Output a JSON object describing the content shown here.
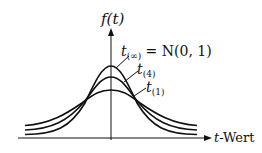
{
  "diagram": {
    "y_axis_label": "f(t)",
    "x_axis_label": "t-Wert",
    "x_axis_label_var": "t",
    "x_axis_label_rest": "-Wert",
    "curves": [
      {
        "name": "t(∞)",
        "sub": "(∞)",
        "eq": " = N(0, 1)",
        "peak_y": 66
      },
      {
        "name": "t(4)",
        "sub": "(4)",
        "peak_y": 77
      },
      {
        "name": "t(1)",
        "sub": "(1)",
        "peak_y": 90
      }
    ],
    "colors": {
      "ink": "#111111",
      "background": "#ffffff"
    }
  }
}
